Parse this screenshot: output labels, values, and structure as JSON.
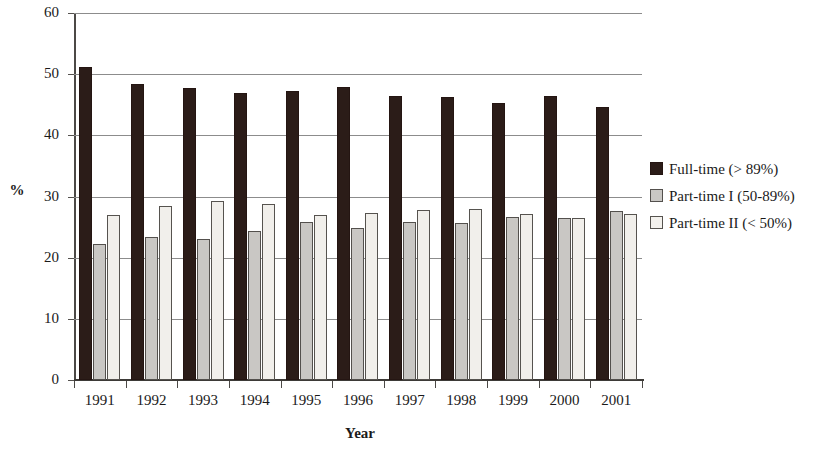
{
  "chart_data": {
    "type": "bar",
    "title": "",
    "xlabel": "Year",
    "ylabel": "%",
    "categories": [
      "1991",
      "1992",
      "1993",
      "1994",
      "1995",
      "1996",
      "1997",
      "1998",
      "1999",
      "2000",
      "2001"
    ],
    "series": [
      {
        "name": "Full-time (> 89%)",
        "color": "#2b1c18",
        "values": [
          51.1,
          48.4,
          47.8,
          47.0,
          47.2,
          47.9,
          46.5,
          46.2,
          45.3,
          46.4,
          44.7
        ]
      },
      {
        "name": "Part-time I (50-89%)",
        "color": "#c9c7c4",
        "values": [
          22.3,
          23.4,
          23.1,
          24.3,
          25.9,
          24.9,
          25.9,
          25.6,
          26.7,
          26.5,
          27.6
        ]
      },
      {
        "name": "Part-time II (< 50%)",
        "color": "#f1efeb",
        "values": [
          27.0,
          28.5,
          29.2,
          28.7,
          26.9,
          27.3,
          27.8,
          28.0,
          27.1,
          26.5,
          27.1
        ]
      }
    ],
    "ylim": [
      0,
      60
    ],
    "yticks": [
      0,
      10,
      20,
      30,
      40,
      50,
      60
    ],
    "ytick_labels": [
      "0",
      "10",
      "20",
      "30",
      "40",
      "50",
      "60"
    ],
    "grid": true,
    "legend_position": "right"
  },
  "legend": {
    "entries": [
      {
        "label": "Full-time (> 89%)"
      },
      {
        "label": "Part-time I (50-89%)"
      },
      {
        "label": "Part-time II (< 50%)"
      }
    ]
  }
}
